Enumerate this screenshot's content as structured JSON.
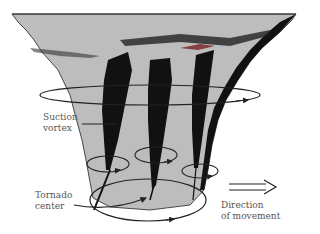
{
  "diagram": {
    "labels": {
      "suction_vortex": [
        "Suction",
        "vortex"
      ],
      "tornado_center": [
        "Tornado",
        "center"
      ],
      "direction": [
        "Direction",
        "of movement"
      ]
    },
    "colors": {
      "funnel_fill": "#bdbdbd",
      "shading": "#111111",
      "outline": "#222222",
      "text": "#555555",
      "background": "#ffffff"
    },
    "suction_vortices_count": 3,
    "rotation_rings_count": 5
  }
}
